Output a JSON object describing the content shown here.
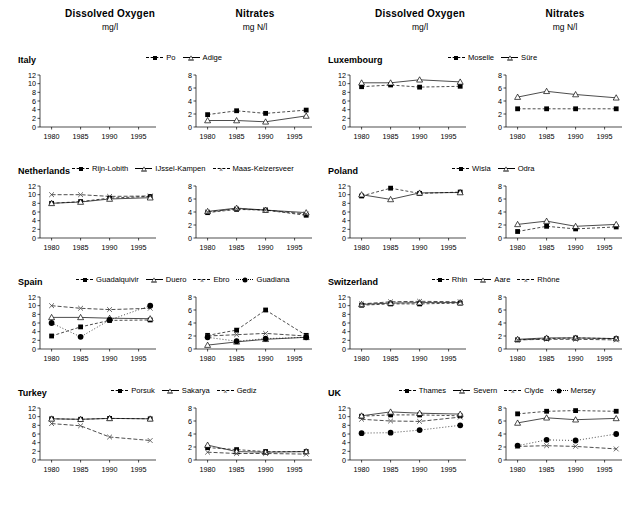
{
  "headers": [
    {
      "title": "Dissolved Oxygen",
      "units": "mg/l"
    },
    {
      "title": "Nitrates",
      "units": "mg N/l"
    },
    {
      "title": "Dissolved Oxygen",
      "units": "mg/l"
    },
    {
      "title": "Nitrates",
      "units": "mg N/l"
    }
  ],
  "axis": {
    "x_ticks": [
      "1980",
      "1985",
      "1990",
      "1995"
    ],
    "do_y_ticks": [
      "0",
      "2",
      "4",
      "6",
      "8",
      "10",
      "12"
    ],
    "nit_y_ticks": [
      "0",
      "2",
      "4",
      "6",
      "8"
    ]
  },
  "countries": [
    {
      "name": "Italy",
      "legend": [
        "Po",
        "Adige"
      ]
    },
    {
      "name": "Luxembourg",
      "legend": [
        "Moselle",
        "Süre"
      ]
    },
    {
      "name": "Netherlands",
      "legend": [
        "Rijn-Lobith",
        "IJssel-Kampen",
        "Maas-Keizersveer"
      ]
    },
    {
      "name": "Poland",
      "legend": [
        "Wisla",
        "Odra"
      ]
    },
    {
      "name": "Spain",
      "legend": [
        "Guadalquivir",
        "Duero",
        "Ebro",
        "Guadiana"
      ]
    },
    {
      "name": "Switzerland",
      "legend": [
        "Rhin",
        "Aare",
        "Rhône"
      ]
    },
    {
      "name": "Turkey",
      "legend": [
        "Porsuk",
        "Sakarya",
        "Gediz"
      ]
    },
    {
      "name": "UK",
      "legend": [
        "Thames",
        "Severn",
        "Clyde",
        "Mersey"
      ]
    }
  ],
  "chart_data": [
    {
      "type": "line",
      "title": "Dissolved Oxygen",
      "subtitle": "Italy",
      "ylabel": "mg/l",
      "x": [
        1980,
        1985,
        1990,
        1997
      ],
      "xlim": [
        1978,
        1998
      ],
      "ylim": [
        0,
        12
      ],
      "grid": false,
      "legend": "top",
      "xlabel": "",
      "series": [
        {
          "name": "Po",
          "values": [
            null,
            null,
            null,
            null
          ]
        },
        {
          "name": "Adige",
          "values": [
            null,
            null,
            null,
            null
          ]
        }
      ]
    },
    {
      "type": "line",
      "title": "Nitrates",
      "subtitle": "Italy",
      "ylabel": "mg N/l",
      "x": [
        1980,
        1985,
        1990,
        1997
      ],
      "xlim": [
        1978,
        1998
      ],
      "ylim": [
        0,
        8
      ],
      "grid": false,
      "legend": "top",
      "xlabel": "",
      "series": [
        {
          "name": "Po",
          "values": [
            1.9,
            2.5,
            2.1,
            2.6
          ]
        },
        {
          "name": "Adige",
          "values": [
            1.0,
            1.0,
            0.8,
            1.7
          ]
        }
      ]
    },
    {
      "type": "line",
      "title": "Dissolved Oxygen",
      "subtitle": "Luxembourg",
      "ylabel": "mg/l",
      "x": [
        1980,
        1985,
        1990,
        1997
      ],
      "xlim": [
        1978,
        1998
      ],
      "ylim": [
        0,
        12
      ],
      "grid": false,
      "legend": "top",
      "xlabel": "",
      "series": [
        {
          "name": "Moselle",
          "values": [
            9.3,
            9.7,
            9.2,
            9.4
          ]
        },
        {
          "name": "Süre",
          "values": [
            10.2,
            10.2,
            10.9,
            10.4
          ]
        }
      ]
    },
    {
      "type": "line",
      "title": "Nitrates",
      "subtitle": "Luxembourg",
      "ylabel": "mg N/l",
      "x": [
        1980,
        1985,
        1990,
        1997
      ],
      "xlim": [
        1978,
        1998
      ],
      "ylim": [
        0,
        8
      ],
      "grid": false,
      "legend": "top",
      "xlabel": "",
      "series": [
        {
          "name": "Moselle",
          "values": [
            2.8,
            2.8,
            2.8,
            2.8
          ]
        },
        {
          "name": "Süre",
          "values": [
            4.6,
            5.5,
            5.0,
            4.5
          ]
        }
      ]
    },
    {
      "type": "line",
      "title": "Dissolved Oxygen",
      "subtitle": "Netherlands",
      "ylabel": "mg/l",
      "x": [
        1980,
        1985,
        1990,
        1997
      ],
      "xlim": [
        1978,
        1998
      ],
      "ylim": [
        0,
        12
      ],
      "grid": false,
      "legend": "top",
      "xlabel": "",
      "series": [
        {
          "name": "Rijn-Lobith",
          "values": [
            8.0,
            8.4,
            9.2,
            9.6
          ]
        },
        {
          "name": "IJssel-Kampen",
          "values": [
            8.0,
            8.3,
            9.0,
            9.3
          ]
        },
        {
          "name": "Maas-Keizersveer",
          "values": [
            10.0,
            10.0,
            9.6,
            9.7
          ]
        }
      ]
    },
    {
      "type": "line",
      "title": "Nitrates",
      "subtitle": "Netherlands",
      "ylabel": "mg N/l",
      "x": [
        1980,
        1985,
        1990,
        1997
      ],
      "xlim": [
        1978,
        1998
      ],
      "ylim": [
        0,
        8
      ],
      "grid": false,
      "legend": "top",
      "xlabel": "",
      "series": [
        {
          "name": "Rijn-Lobith",
          "values": [
            3.9,
            4.4,
            4.3,
            3.5
          ]
        },
        {
          "name": "IJssel-Kampen",
          "values": [
            4.1,
            4.6,
            4.3,
            3.9
          ]
        },
        {
          "name": "Maas-Keizersveer",
          "values": [
            4.0,
            4.5,
            4.3,
            3.7
          ]
        }
      ]
    },
    {
      "type": "line",
      "title": "Dissolved Oxygen",
      "subtitle": "Poland",
      "ylabel": "mg/l",
      "x": [
        1980,
        1985,
        1990,
        1997
      ],
      "xlim": [
        1978,
        1998
      ],
      "ylim": [
        0,
        12
      ],
      "grid": false,
      "legend": "top",
      "xlabel": "",
      "series": [
        {
          "name": "Wisla",
          "values": [
            9.7,
            11.5,
            10.3,
            10.6
          ]
        },
        {
          "name": "Odra",
          "values": [
            10.0,
            8.9,
            10.4,
            10.5
          ]
        }
      ]
    },
    {
      "type": "line",
      "title": "Nitrates",
      "subtitle": "Poland",
      "ylabel": "mg N/l",
      "x": [
        1980,
        1985,
        1990,
        1997
      ],
      "xlim": [
        1978,
        1998
      ],
      "ylim": [
        0,
        8
      ],
      "grid": false,
      "legend": "top",
      "xlabel": "",
      "series": [
        {
          "name": "Wisla",
          "values": [
            1.0,
            1.8,
            1.4,
            1.7
          ]
        },
        {
          "name": "Odra",
          "values": [
            2.1,
            2.6,
            1.8,
            2.1
          ]
        }
      ]
    },
    {
      "type": "line",
      "title": "Dissolved Oxygen",
      "subtitle": "Spain",
      "ylabel": "mg/l",
      "x": [
        1980,
        1985,
        1990,
        1997
      ],
      "xlim": [
        1978,
        1998
      ],
      "ylim": [
        0,
        12
      ],
      "grid": false,
      "legend": "top",
      "xlabel": "",
      "series": [
        {
          "name": "Guadalquivir",
          "values": [
            3.0,
            5.1,
            6.6,
            6.7
          ]
        },
        {
          "name": "Duero",
          "values": [
            7.3,
            7.3,
            7.1,
            7.0
          ]
        },
        {
          "name": "Ebro",
          "values": [
            10.0,
            9.4,
            9.1,
            9.4
          ]
        },
        {
          "name": "Guadiana",
          "values": [
            6.0,
            2.8,
            6.7,
            10.0
          ]
        }
      ]
    },
    {
      "type": "line",
      "title": "Nitrates",
      "subtitle": "Spain",
      "ylabel": "mg N/l",
      "x": [
        1980,
        1985,
        1990,
        1997
      ],
      "xlim": [
        1978,
        1998
      ],
      "ylim": [
        0,
        8
      ],
      "grid": false,
      "legend": "top",
      "xlabel": "",
      "series": [
        {
          "name": "Guadalquivir",
          "values": [
            2.1,
            2.9,
            6.0,
            2.1
          ]
        },
        {
          "name": "Duero",
          "values": [
            0.6,
            1.1,
            1.5,
            1.8
          ]
        },
        {
          "name": "Ebro",
          "values": [
            2.0,
            2.2,
            2.4,
            2.0
          ]
        },
        {
          "name": "Guadiana",
          "values": [
            1.8,
            1.2,
            1.6,
            1.8
          ]
        }
      ]
    },
    {
      "type": "line",
      "title": "Dissolved Oxygen",
      "subtitle": "Switzerland",
      "ylabel": "mg/l",
      "x": [
        1980,
        1985,
        1990,
        1997
      ],
      "xlim": [
        1978,
        1998
      ],
      "ylim": [
        0,
        12
      ],
      "grid": false,
      "legend": "top",
      "xlabel": "",
      "series": [
        {
          "name": "Rhin",
          "values": [
            10.1,
            10.4,
            10.4,
            10.6
          ]
        },
        {
          "name": "Aare",
          "values": [
            10.3,
            10.6,
            10.7,
            10.7
          ]
        },
        {
          "name": "Rhône",
          "values": [
            10.4,
            10.9,
            11.0,
            10.9
          ]
        }
      ]
    },
    {
      "type": "line",
      "title": "Nitrates",
      "subtitle": "Switzerland",
      "ylabel": "mg N/l",
      "x": [
        1980,
        1985,
        1990,
        1997
      ],
      "xlim": [
        1978,
        1998
      ],
      "ylim": [
        0,
        8
      ],
      "grid": false,
      "legend": "top",
      "xlabel": "",
      "series": [
        {
          "name": "Rhin",
          "values": [
            1.4,
            1.6,
            1.7,
            1.6
          ]
        },
        {
          "name": "Aare",
          "values": [
            1.5,
            1.7,
            1.7,
            1.6
          ]
        },
        {
          "name": "Rhône",
          "values": [
            1.4,
            1.5,
            1.5,
            1.4
          ]
        }
      ]
    },
    {
      "type": "line",
      "title": "Dissolved Oxygen",
      "subtitle": "Turkey",
      "ylabel": "mg/l",
      "x": [
        1980,
        1985,
        1990,
        1997
      ],
      "xlim": [
        1978,
        1998
      ],
      "ylim": [
        0,
        12
      ],
      "grid": false,
      "legend": "top",
      "xlabel": "",
      "series": [
        {
          "name": "Porsuk",
          "values": [
            9.5,
            9.4,
            9.6,
            9.5
          ]
        },
        {
          "name": "Sakarya",
          "values": [
            9.5,
            9.4,
            9.6,
            9.5
          ]
        },
        {
          "name": "Gediz",
          "values": [
            8.4,
            7.9,
            5.3,
            4.5
          ]
        }
      ]
    },
    {
      "type": "line",
      "title": "Nitrates",
      "subtitle": "Turkey",
      "ylabel": "mg N/l",
      "x": [
        1980,
        1985,
        1990,
        1997
      ],
      "xlim": [
        1978,
        1998
      ],
      "ylim": [
        0,
        8
      ],
      "grid": false,
      "legend": "top",
      "xlabel": "",
      "series": [
        {
          "name": "Porsuk",
          "values": [
            1.9,
            1.6,
            1.3,
            1.3
          ]
        },
        {
          "name": "Sakarya",
          "values": [
            2.3,
            1.3,
            1.2,
            1.3
          ]
        },
        {
          "name": "Gediz",
          "values": [
            1.2,
            1.0,
            1.0,
            0.9
          ]
        }
      ]
    },
    {
      "type": "line",
      "title": "Dissolved Oxygen",
      "subtitle": "UK",
      "ylabel": "mg/l",
      "x": [
        1980,
        1985,
        1990,
        1997
      ],
      "xlim": [
        1978,
        1998
      ],
      "ylim": [
        0,
        12
      ],
      "grid": false,
      "legend": "top",
      "xlabel": "",
      "series": [
        {
          "name": "Thames",
          "values": [
            10.1,
            10.4,
            10.4,
            10.2
          ]
        },
        {
          "name": "Severn",
          "values": [
            10.2,
            11.1,
            10.8,
            10.6
          ]
        },
        {
          "name": "Clyde",
          "values": [
            9.4,
            9.0,
            8.9,
            9.9
          ]
        },
        {
          "name": "Mersey",
          "values": [
            6.2,
            6.3,
            6.9,
            8.0
          ]
        }
      ]
    },
    {
      "type": "line",
      "title": "Nitrates",
      "subtitle": "UK",
      "ylabel": "mg N/l",
      "x": [
        1980,
        1985,
        1990,
        1997
      ],
      "xlim": [
        1978,
        1998
      ],
      "ylim": [
        0,
        8
      ],
      "grid": false,
      "legend": "top",
      "xlabel": "",
      "series": [
        {
          "name": "Thames",
          "values": [
            7.1,
            7.5,
            7.6,
            7.5
          ]
        },
        {
          "name": "Severn",
          "values": [
            5.7,
            6.5,
            6.2,
            6.4
          ]
        },
        {
          "name": "Clyde",
          "values": [
            2.1,
            2.2,
            2.1,
            1.7
          ]
        },
        {
          "name": "Mersey",
          "values": [
            2.2,
            3.1,
            3.0,
            4.0
          ]
        }
      ]
    }
  ]
}
